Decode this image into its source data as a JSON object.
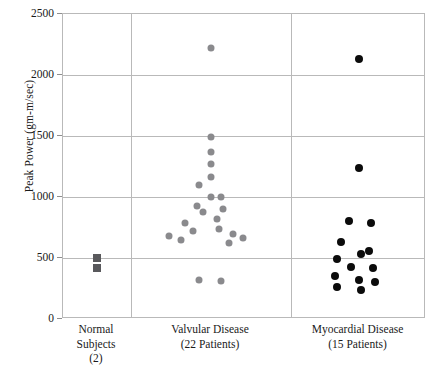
{
  "chart_data": {
    "type": "scatter",
    "title": "",
    "xlabel": "",
    "ylabel": "Peak Power (gm-m/sec)",
    "ylim": [
      0,
      2500
    ],
    "yticks": [
      0,
      500,
      1000,
      1500,
      2000,
      2500
    ],
    "ytick_labels": [
      "0",
      "500",
      "1000",
      "1500",
      "2000",
      "2500"
    ],
    "grid": true,
    "legend": "none",
    "groups": [
      {
        "name": "Normal Subjects",
        "count_label": "(2)",
        "marker": "square",
        "color": "#59595c",
        "n": 2,
        "values": [
          500,
          420
        ]
      },
      {
        "name": "Valvular Disease",
        "count_label": "(22 Patients)",
        "marker": "circle",
        "color": "#8a8a8d",
        "n": 22,
        "values": [
          2220,
          1490,
          1370,
          1270,
          1160,
          1100,
          1000,
          1000,
          930,
          900,
          880,
          820,
          790,
          740,
          720,
          700,
          680,
          660,
          650,
          620,
          320,
          310
        ]
      },
      {
        "name": "Myocardial Disease",
        "count_label": "(15 Patients)",
        "marker": "circle",
        "color": "#0b0b0b",
        "n": 15,
        "values": [
          2130,
          1235,
          800,
          790,
          630,
          560,
          530,
          490,
          430,
          420,
          350,
          320,
          300,
          260,
          240
        ]
      }
    ]
  }
}
